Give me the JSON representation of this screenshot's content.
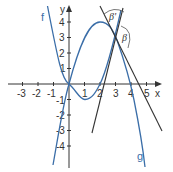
{
  "axes": {
    "x_label": "x",
    "y_label": "y",
    "x_ticks": [
      "-3",
      "-2",
      "-1",
      "1",
      "2",
      "3",
      "4",
      "5"
    ],
    "y_ticks": [
      "4",
      "3",
      "2",
      "1",
      "-1",
      "-2",
      "-3",
      "-4"
    ]
  },
  "curves": {
    "f_label": "f",
    "g_label": "g",
    "color": "#3b6ea8"
  },
  "angles": {
    "beta_prime": "β'",
    "beta": "β"
  }
}
